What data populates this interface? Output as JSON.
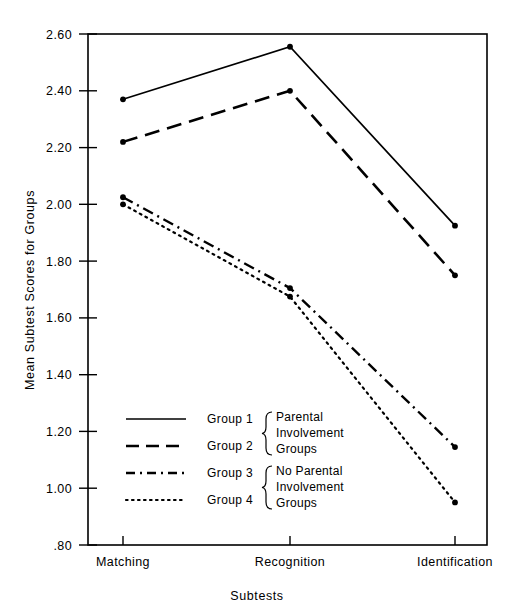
{
  "chart_data": {
    "type": "line",
    "title": "",
    "xlabel": "Subtests",
    "ylabel": "Mean Subtest Scores for Groups",
    "categories": [
      "Matching",
      "Recognition",
      "Identification"
    ],
    "ylim": [
      0.8,
      2.6
    ],
    "ytick_labels": [
      "2.60",
      "2.40",
      "2.20",
      "2.00",
      "1.80",
      "1.60",
      "1.40",
      "1.20",
      "1.00",
      ".80"
    ],
    "ytick_values": [
      2.6,
      2.4,
      2.2,
      2.0,
      1.8,
      1.6,
      1.4,
      1.2,
      1.0,
      0.8
    ],
    "grid": false,
    "legend_position": "lower-left-inside",
    "series": [
      {
        "name": "Group 1",
        "style": "solid",
        "values": [
          2.37,
          2.555,
          1.925
        ]
      },
      {
        "name": "Group 2",
        "style": "dashed",
        "values": [
          2.22,
          2.4,
          1.75
        ]
      },
      {
        "name": "Group 3",
        "style": "dash-dot",
        "values": [
          2.025,
          1.705,
          1.145
        ]
      },
      {
        "name": "Group 4",
        "style": "dotted",
        "values": [
          2.0,
          1.675,
          0.95
        ]
      }
    ]
  },
  "legend": {
    "entries": [
      {
        "label": "Group 1",
        "style": "solid"
      },
      {
        "label": "Group 2",
        "style": "dashed"
      },
      {
        "label": "Group 3",
        "style": "dash-dot"
      },
      {
        "label": "Group 4",
        "style": "dotted"
      }
    ],
    "brace_groups": [
      {
        "lines": [
          "Parental",
          "Involvement",
          "Groups"
        ]
      },
      {
        "lines": [
          "No  Parental",
          "Involvement",
          "Groups"
        ]
      }
    ]
  },
  "colors": {
    "ink": "#000000",
    "background": "#ffffff"
  }
}
